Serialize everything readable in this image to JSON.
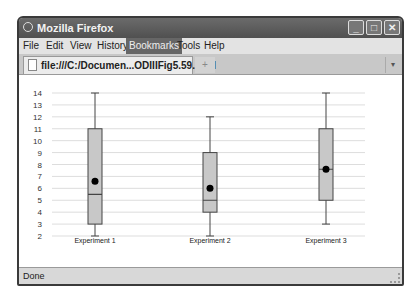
{
  "window": {
    "title": "Mozilla Firefox",
    "controls": {
      "minimize": "_",
      "maximize": "□",
      "close": "✕"
    }
  },
  "menubar": {
    "items": [
      {
        "label": "File"
      },
      {
        "label": "Edit"
      },
      {
        "label": "View"
      },
      {
        "label": "History"
      },
      {
        "label": "Bookmarks"
      },
      {
        "label": "Tools"
      },
      {
        "label": "Help"
      }
    ]
  },
  "tabs": {
    "active_label": "file:///C:/Documen...ODIIIFig5.59.html",
    "new_tab_label": "+",
    "overflow_label": "▾"
  },
  "statusbar": {
    "text": "Done"
  },
  "colors": {
    "box_fill": "#c8c8c8",
    "box_stroke": "#444444",
    "mean_dot": "#000000",
    "grid": "#dddddd"
  },
  "chart_data": {
    "type": "boxplot",
    "title": "",
    "xlabel": "",
    "ylabel": "",
    "ylim": [
      2,
      14
    ],
    "yticks": [
      2,
      3,
      4,
      5,
      6,
      7,
      8,
      9,
      10,
      11,
      12,
      13,
      14
    ],
    "grid": true,
    "legend": null,
    "categories": [
      "Experiment 1",
      "Experiment 2",
      "Experiment 3"
    ],
    "series": [
      {
        "name": "Experiment 1",
        "min": 2,
        "q1": 3,
        "median": 5.5,
        "q3": 11,
        "max": 14,
        "mean": 6.6
      },
      {
        "name": "Experiment 2",
        "min": 2,
        "q1": 4,
        "median": 5,
        "q3": 9,
        "max": 12,
        "mean": 6
      },
      {
        "name": "Experiment 3",
        "min": 3,
        "q1": 5,
        "median": 7.6,
        "q3": 11,
        "max": 14,
        "mean": 7.6
      }
    ]
  }
}
